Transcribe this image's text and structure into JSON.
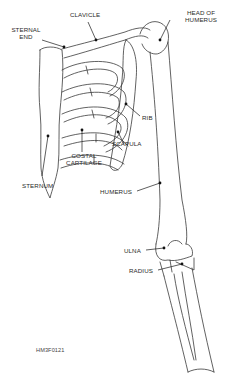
{
  "figure": {
    "code": "HM3F0121",
    "colors": {
      "line": "#3a3a3a",
      "text": "#2a2a2a",
      "background": "#ffffff"
    }
  },
  "labels": {
    "clavicle": "CLAVICLE",
    "sternal_end_1": "STERNAL",
    "sternal_end_2": "END",
    "head_of_humerus_1": "HEAD OF",
    "head_of_humerus_2": "HUMERUS",
    "rib": "RIB",
    "scapula": "SCAPULA",
    "costal_cartilage_1": "COSTAL",
    "costal_cartilage_2": "CARTILAGE",
    "sternum": "STERNUM",
    "humerus": "HUMERUS",
    "ulna": "ULNA",
    "radius": "RADIUS"
  }
}
